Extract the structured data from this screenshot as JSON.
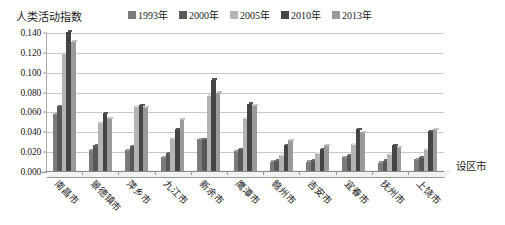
{
  "axis_titles": {
    "y": "人类活动指数",
    "x": "设区市"
  },
  "legend": {
    "items": [
      {
        "label": "1993年",
        "color": "#7b7b7b"
      },
      {
        "label": "2000年",
        "color": "#585858"
      },
      {
        "label": "2005年",
        "color": "#b4b4b4"
      },
      {
        "label": "2010年",
        "color": "#454545"
      },
      {
        "label": "2013年",
        "color": "#9a9a9a"
      }
    ]
  },
  "y_ticks": [
    "0.140",
    "0.120",
    "0.100",
    "0.080",
    "0.060",
    "0.040",
    "0.020",
    "0.000"
  ],
  "chart_data": {
    "type": "bar",
    "title": "",
    "xlabel": "设区市",
    "ylabel": "人类活动指数",
    "ylim": [
      0,
      0.14
    ],
    "ytick_step": 0.02,
    "grid": true,
    "legend_position": "top",
    "categories": [
      "南昌市",
      "景德镇市",
      "萍乡市",
      "九江市",
      "新余市",
      "鹰潭市",
      "赣州市",
      "吉安市",
      "宜春市",
      "抚州市",
      "上饶市"
    ],
    "series": [
      {
        "name": "1993年",
        "color": "#7b7b7b",
        "values": [
          0.057,
          0.021,
          0.021,
          0.014,
          0.032,
          0.02,
          0.009,
          0.009,
          0.014,
          0.008,
          0.012
        ]
      },
      {
        "name": "2000年",
        "color": "#585858",
        "values": [
          0.065,
          0.026,
          0.025,
          0.018,
          0.032,
          0.022,
          0.01,
          0.011,
          0.016,
          0.01,
          0.014
        ]
      },
      {
        "name": "2005年",
        "color": "#b4b4b4",
        "values": [
          0.118,
          0.049,
          0.065,
          0.033,
          0.076,
          0.053,
          0.016,
          0.018,
          0.027,
          0.017,
          0.022
        ]
      },
      {
        "name": "2010年",
        "color": "#454545",
        "values": [
          0.14,
          0.058,
          0.066,
          0.042,
          0.092,
          0.068,
          0.026,
          0.022,
          0.042,
          0.026,
          0.04
        ]
      },
      {
        "name": "2013年",
        "color": "#9a9a9a",
        "values": [
          0.13,
          0.053,
          0.064,
          0.052,
          0.079,
          0.066,
          0.031,
          0.026,
          0.039,
          0.024,
          0.042
        ]
      }
    ]
  }
}
